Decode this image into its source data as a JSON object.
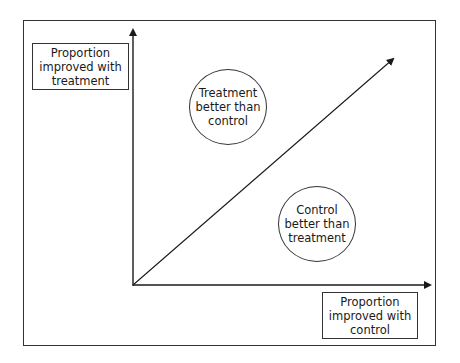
{
  "diagram": {
    "type": "quadrant-comparison",
    "y_axis": {
      "label": "Proportion\nimproved with\ntreatment"
    },
    "x_axis": {
      "label": "Proportion\nimproved with\ncontrol"
    },
    "diagonal": {
      "description": "line of equality (y = x)"
    },
    "regions": [
      {
        "label": "Treatment\nbetter than\ncontrol",
        "position": "above diagonal"
      },
      {
        "label": "Control\nbetter than\ntreatment",
        "position": "below diagonal"
      }
    ],
    "colors": {
      "line": "#1a1a1a",
      "border": "#333333",
      "background": "#ffffff"
    }
  }
}
